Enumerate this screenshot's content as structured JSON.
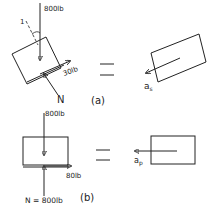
{
  "figure": {
    "panel_a": {
      "caption": "(a)",
      "weight_label": "800lb",
      "friction_label": "30lb",
      "normal_label": "N",
      "angle_marker": "1",
      "accel_label": "a",
      "accel_subscript": "s",
      "equals": "="
    },
    "panel_b": {
      "caption": "(b)",
      "weight_label": "800lb",
      "friction_label": "80lb",
      "normal_label": "N = 800lb",
      "accel_label": "a",
      "accel_subscript": "p",
      "equals": "="
    },
    "colors": {
      "ink": "#222222",
      "background": "#ffffff"
    }
  }
}
